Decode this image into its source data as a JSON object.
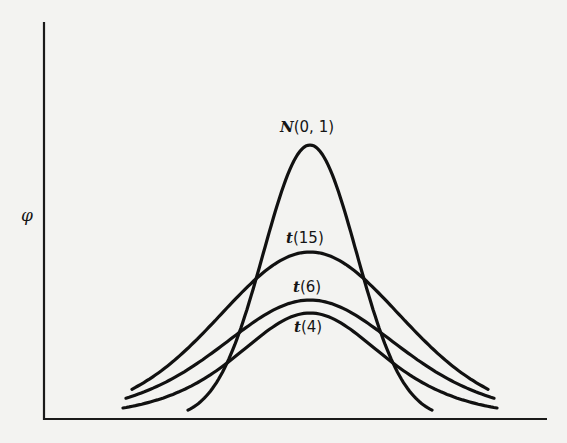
{
  "chart_data": {
    "type": "line",
    "title": "",
    "xlabel": "",
    "ylabel": "φ",
    "grid": false,
    "legend": "inline labels above each curve peak",
    "x_range": [
      -4,
      4
    ],
    "series": [
      {
        "name": "N(0, 1)",
        "label_italic": "N",
        "label_rest": "(0, 1)",
        "df": null,
        "peak_pixel_y": 145,
        "tail_half_width_px": 122
      },
      {
        "name": "t(15)",
        "label_italic": "t",
        "label_rest": "(15)",
        "df": 15,
        "peak_pixel_y": 252,
        "tail_half_width_px": 178
      },
      {
        "name": "t(6)",
        "label_italic": "t",
        "label_rest": "(6)",
        "df": 6,
        "peak_pixel_y": 300,
        "tail_half_width_px": 184
      },
      {
        "name": "t(4)",
        "label_italic": "t",
        "label_rest": "(4)",
        "df": 4,
        "peak_pixel_y": 313,
        "tail_half_width_px": 187
      }
    ],
    "tail_end_pixel_y": [
      410,
      389,
      398,
      408
    ]
  },
  "labels": {
    "y_axis": "φ",
    "n01_italic": "N",
    "n01_rest": "(0, 1)",
    "t15_italic": "t",
    "t15_rest": "(15)",
    "t6_italic": "t",
    "t6_rest": "(6)",
    "t4_italic": "t",
    "t4_rest": "(4)"
  }
}
